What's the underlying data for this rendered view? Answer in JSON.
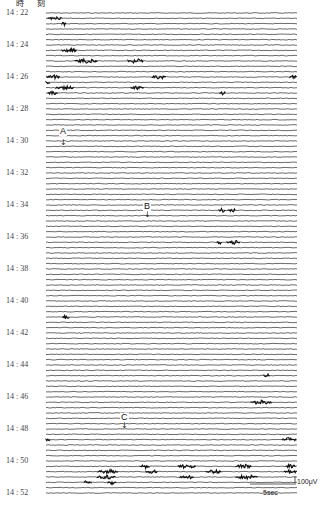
{
  "header": {
    "title": "時 刻"
  },
  "chart_data": {
    "type": "line",
    "title": "",
    "ylabel": "時刻",
    "xlabel": "",
    "time_labels": [
      "14:22",
      "14:24",
      "14:26",
      "14:28",
      "14:30",
      "14:32",
      "14:34",
      "14:36",
      "14:38",
      "14:40",
      "14:42",
      "14:44",
      "14:46",
      "14:48",
      "14:50",
      "14:52"
    ],
    "time_range": [
      "14:22",
      "14:52"
    ],
    "rows_per_minute": 3,
    "row_count": 91,
    "scale_bar": {
      "time": "5sec",
      "amplitude": "100μV"
    },
    "annotations": [
      {
        "label": "A",
        "time": "14:29"
      },
      {
        "label": "B",
        "time": "14:35"
      },
      {
        "label": "C",
        "time": "14:49:40"
      }
    ],
    "bursts": [
      {
        "row": 1,
        "x0": 48,
        "x1": 62
      },
      {
        "row": 2,
        "x0": 62,
        "x1": 66
      },
      {
        "row": 7,
        "x0": 62,
        "x1": 77
      },
      {
        "row": 7,
        "x0": 70,
        "x1": 76
      },
      {
        "row": 9,
        "x0": 75,
        "x1": 98
      },
      {
        "row": 9,
        "x0": 128,
        "x1": 144
      },
      {
        "row": 12,
        "x0": 47,
        "x1": 60
      },
      {
        "row": 12,
        "x0": 152,
        "x1": 166
      },
      {
        "row": 12,
        "x0": 290,
        "x1": 297
      },
      {
        "row": 13,
        "x0": 46,
        "x1": 50
      },
      {
        "row": 14,
        "x0": 56,
        "x1": 74
      },
      {
        "row": 14,
        "x0": 131,
        "x1": 144
      },
      {
        "row": 15,
        "x0": 48,
        "x1": 58
      },
      {
        "row": 15,
        "x0": 220,
        "x1": 226
      },
      {
        "row": 37,
        "x0": 219,
        "x1": 226
      },
      {
        "row": 37,
        "x0": 228,
        "x1": 236
      },
      {
        "row": 43,
        "x0": 217,
        "x1": 222
      },
      {
        "row": 43,
        "x0": 227,
        "x1": 240
      },
      {
        "row": 57,
        "x0": 63,
        "x1": 70
      },
      {
        "row": 68,
        "x0": 264,
        "x1": 270
      },
      {
        "row": 73,
        "x0": 251,
        "x1": 272
      },
      {
        "row": 80,
        "x0": 282,
        "x1": 297
      },
      {
        "row": 80,
        "x0": 46,
        "x1": 50
      },
      {
        "row": 85,
        "x0": 140,
        "x1": 150
      },
      {
        "row": 85,
        "x0": 178,
        "x1": 196
      },
      {
        "row": 85,
        "x0": 236,
        "x1": 252
      },
      {
        "row": 85,
        "x0": 286,
        "x1": 296
      },
      {
        "row": 86,
        "x0": 98,
        "x1": 118
      },
      {
        "row": 86,
        "x0": 146,
        "x1": 158
      },
      {
        "row": 86,
        "x0": 206,
        "x1": 222
      },
      {
        "row": 86,
        "x0": 284,
        "x1": 297
      },
      {
        "row": 87,
        "x0": 97,
        "x1": 116
      },
      {
        "row": 87,
        "x0": 180,
        "x1": 194
      },
      {
        "row": 87,
        "x0": 236,
        "x1": 258
      },
      {
        "row": 88,
        "x0": 108,
        "x1": 116
      },
      {
        "row": 88,
        "x0": 84,
        "x1": 92
      }
    ]
  },
  "markers": {
    "a": {
      "label": "A",
      "arrow": "↓"
    },
    "b": {
      "label": "B",
      "arrow": "↓"
    },
    "c": {
      "label": "C",
      "arrow": "↓"
    }
  },
  "scale": {
    "amplitude_label": "100μV",
    "time_label": "5sec"
  }
}
